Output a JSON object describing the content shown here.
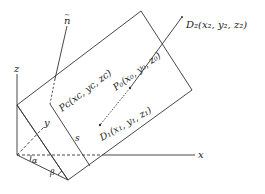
{
  "diagram": {
    "type": "3D geometry: plane with normal and line segment",
    "stroke_color": "#333333",
    "axes": {
      "x": "x",
      "y": "y",
      "z": "z"
    },
    "normal_label": "n",
    "angles": {
      "alpha": "α",
      "beta": "β"
    },
    "side_label": "s",
    "points": {
      "D2": "D₂(x₂, y₂, z₂)",
      "P0": "P₀(x₀, y₀, z₀)",
      "Pc": "Pᴄ(xᴄ, yᴄ, zᴄ)",
      "D1": "D₁(x₁, y₁, z₁)"
    }
  }
}
